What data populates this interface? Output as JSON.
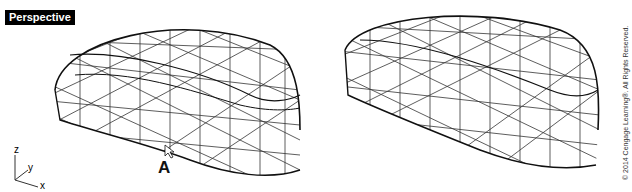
{
  "viewport": {
    "label": "Perspective",
    "callout_label": "A",
    "axes": {
      "z": "z",
      "y": "y",
      "x": "x"
    },
    "copyright": "© 2014 Cengage Learning®. All Rights Reserved."
  },
  "colors": {
    "background": "#ffffff",
    "wireframe": "#111111",
    "label_bg": "#000000",
    "label_text": "#ffffff"
  }
}
